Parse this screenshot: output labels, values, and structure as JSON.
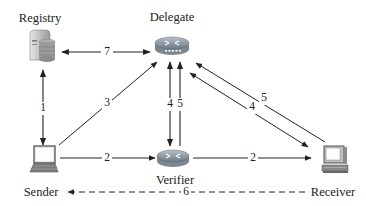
{
  "diagram": {
    "nodes": {
      "registry": {
        "label": "Registry",
        "icon": "server-database-icon"
      },
      "delegate": {
        "label": "Delegate",
        "icon": "router-icon"
      },
      "sender": {
        "label": "Sender",
        "icon": "laptop-icon"
      },
      "verifier": {
        "label": "Verifier",
        "icon": "router-icon"
      },
      "receiver": {
        "label": "Receiver",
        "icon": "desktop-computer-icon"
      }
    },
    "edges": [
      {
        "id": "e1",
        "from": "sender",
        "to": "registry",
        "label": "1",
        "direction": "bidirectional",
        "style": "solid"
      },
      {
        "id": "e2a",
        "from": "sender",
        "to": "verifier",
        "label": "2",
        "direction": "forward",
        "style": "solid"
      },
      {
        "id": "e2b",
        "from": "verifier",
        "to": "receiver",
        "label": "2",
        "direction": "forward",
        "style": "solid"
      },
      {
        "id": "e3",
        "from": "sender",
        "to": "delegate",
        "label": "3",
        "direction": "forward",
        "style": "solid"
      },
      {
        "id": "e4v",
        "from": "delegate",
        "to": "verifier",
        "label": "4",
        "direction": "bidirectional",
        "style": "solid"
      },
      {
        "id": "e5v",
        "from": "verifier",
        "to": "delegate",
        "label": "5",
        "direction": "forward",
        "style": "solid"
      },
      {
        "id": "e4r",
        "from": "delegate",
        "to": "receiver",
        "label": "4",
        "direction": "bidirectional",
        "style": "solid"
      },
      {
        "id": "e5r",
        "from": "receiver",
        "to": "delegate",
        "label": "5",
        "direction": "forward",
        "style": "solid"
      },
      {
        "id": "e6",
        "from": "receiver",
        "to": "sender",
        "label": "6",
        "direction": "forward",
        "style": "dashed"
      },
      {
        "id": "e7",
        "from": "registry",
        "to": "delegate",
        "label": "7",
        "direction": "bidirectional",
        "style": "solid"
      }
    ],
    "colors": {
      "line": "#222222",
      "router_body": "#7d8a94",
      "router_top": "#a9b4bc",
      "server_body": "#c8c8c8",
      "laptop_body": "#6f6f6f"
    }
  }
}
